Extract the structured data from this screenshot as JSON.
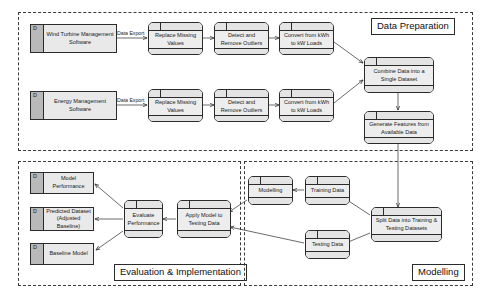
{
  "diagram": {
    "groups": [
      {
        "id": "data-preparation",
        "label": "Data Preparation"
      },
      {
        "id": "evaluation-implementation",
        "label": "Evaluation & Implementation"
      },
      {
        "id": "modelling",
        "label": "Modelling"
      }
    ],
    "stores": [
      {
        "id": "wind-turbine-management-software",
        "marker": "D",
        "label": "Wind Turbine Management Software"
      },
      {
        "id": "energy-management-software",
        "marker": "D",
        "label": "Energy Management Software"
      },
      {
        "id": "model-performance",
        "marker": "D",
        "label": "Model Performance"
      },
      {
        "id": "predicted-dataset",
        "marker": "D",
        "label": "Predicted Dataset (Adjusted Baseline)"
      },
      {
        "id": "baseline-model",
        "marker": "D",
        "label": "Baseline Model"
      }
    ],
    "processes": [
      {
        "id": "replace-missing-values-1",
        "label": "Replace Missing Values"
      },
      {
        "id": "detect-remove-outliers-1",
        "label": "Detect and Remove Outliers"
      },
      {
        "id": "convert-kwh-kw-1",
        "label": "Convert from kWh to kW Loads"
      },
      {
        "id": "replace-missing-values-2",
        "label": "Replace Missing Values"
      },
      {
        "id": "detect-remove-outliers-2",
        "label": "Detect and Remove Outliers"
      },
      {
        "id": "convert-kwh-kw-2",
        "label": "Convert from kWh to kW Loads"
      },
      {
        "id": "combine-data-single-dataset",
        "label": "Combine Data into a Single Dataset"
      },
      {
        "id": "generate-features",
        "label": "Generate Features from Available Data"
      },
      {
        "id": "split-data",
        "label": "Split Data into Training & Testing Datasets"
      },
      {
        "id": "training-data",
        "label": "Training Data"
      },
      {
        "id": "testing-data",
        "label": "Testing Data"
      },
      {
        "id": "modelling-process",
        "label": "Modelling"
      },
      {
        "id": "apply-model-testing-data",
        "label": "Apply Model to Testing Data"
      },
      {
        "id": "evaluate-performance",
        "label": "Evaluate Performance"
      }
    ],
    "edge_labels": [
      {
        "id": "data-export-1",
        "label": "Data Export"
      },
      {
        "id": "data-export-2",
        "label": "Data Export"
      }
    ]
  }
}
